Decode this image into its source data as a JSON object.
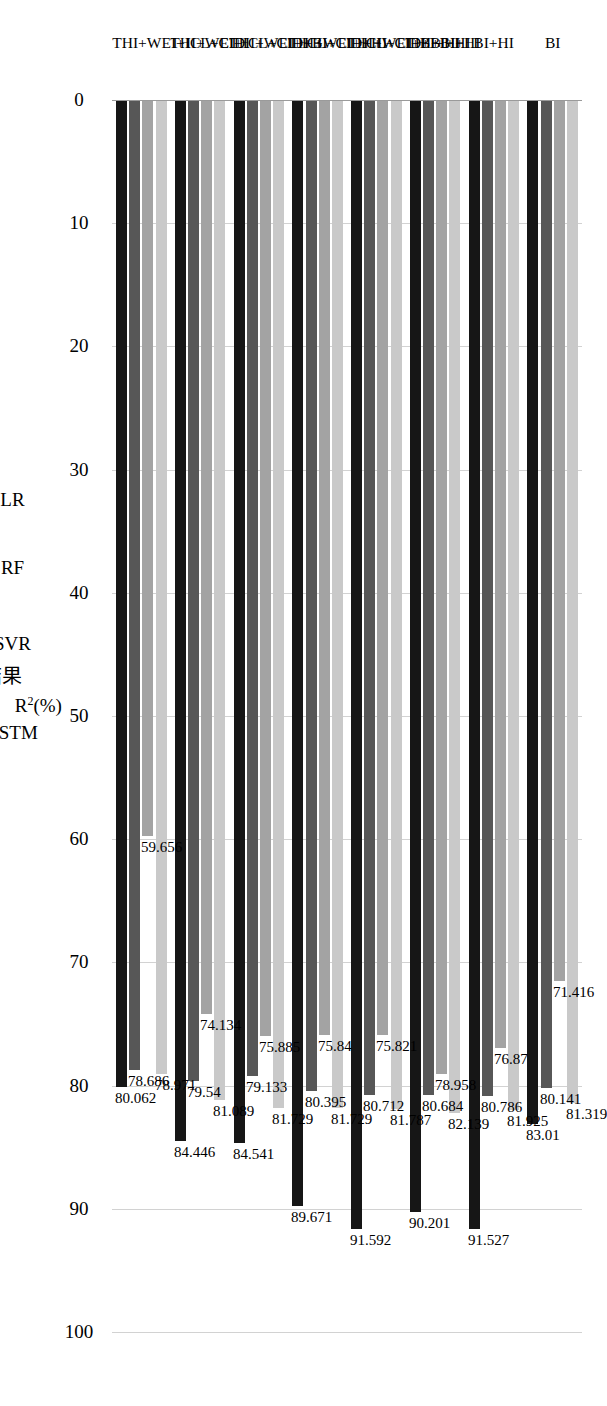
{
  "caption": "(a) R方测试结果",
  "chart_data": {
    "type": "bar",
    "orientation": "horizontal",
    "title": "",
    "xlabel": "",
    "ylabel": "R²(%)",
    "ylim": [
      0,
      100
    ],
    "ytick_labels": [
      "0",
      "10",
      "20",
      "30",
      "40",
      "50",
      "60",
      "70",
      "80",
      "90",
      "100"
    ],
    "ytick_values": [
      0,
      10,
      20,
      30,
      40,
      50,
      60,
      70,
      80,
      90,
      100
    ],
    "grid": true,
    "legend_position": "bottom",
    "categories": [
      "BI",
      "BI+HI",
      "THI+BI+HI",
      "THI+WEI+BI+HI",
      "THI+WEI+ICL+CID+BI+HI",
      "THI+WEI+ICL+CID+HI",
      "THI+WEI+ICL+CID+BI",
      "THI+WEI+ICL+CID"
    ],
    "series": [
      {
        "name": "LSTM",
        "color": "#161616",
        "values": [
          83.01,
          91.527,
          90.201,
          91.592,
          89.671,
          84.541,
          84.446,
          80.062
        ],
        "labels": [
          "83.01",
          "91.527",
          "90.201",
          "91.592",
          "89.671",
          "84.541",
          "84.446",
          "80.062"
        ]
      },
      {
        "name": "SVR",
        "color": "#575757",
        "values": [
          80.141,
          80.786,
          80.684,
          80.712,
          80.395,
          79.133,
          79.54,
          78.686
        ],
        "labels": [
          "80.141",
          "80.786",
          "80.684",
          "80.712",
          "80.395",
          "79.133",
          "79.54",
          "78.686"
        ]
      },
      {
        "name": "RF",
        "color": "#a3a3a3",
        "values": [
          71.416,
          76.87,
          78.958,
          75.821,
          75.84,
          75.885,
          74.134,
          59.656
        ],
        "labels": [
          "71.416",
          "76.87",
          "78.958",
          "75.821",
          "75.84",
          "75.885",
          "74.134",
          "59.656"
        ]
      },
      {
        "name": "LR",
        "color": "#c9c9c9",
        "values": [
          81.319,
          81.925,
          82.139,
          81.787,
          81.729,
          81.729,
          81.089,
          78.971
        ],
        "labels": [
          "81.319",
          "81.925",
          "82.139",
          "81.787",
          "81.729",
          "81.729",
          "81.089",
          "78.971"
        ]
      }
    ]
  }
}
